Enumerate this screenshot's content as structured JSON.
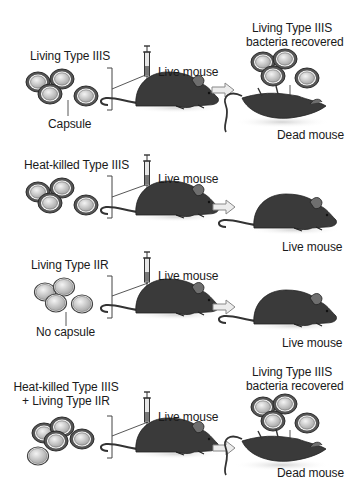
{
  "experiments": [
    {
      "injected_label": "Living Type IIIS",
      "bacteria_annotation": "Capsule",
      "injection_target": "Live mouse",
      "result_bacteria_label_line1": "Living Type IIIS",
      "result_bacteria_label_line2": "bacteria recovered",
      "outcome": "Dead mouse"
    },
    {
      "injected_label": "Heat-killed Type IIIS",
      "injection_target": "Live mouse",
      "outcome": "Live mouse"
    },
    {
      "injected_label": "Living Type IIR",
      "bacteria_annotation": "No capsule",
      "injection_target": "Live mouse",
      "outcome": "Live mouse"
    },
    {
      "injected_label_line1": "Heat-killed Type IIIS",
      "injected_label_line2": "+ Living Type IIR",
      "injection_target": "Live mouse",
      "result_bacteria_label_line1": "Living Type IIIS",
      "result_bacteria_label_line2": "bacteria recovered",
      "outcome": "Dead mouse"
    }
  ],
  "icons": [
    "bacteria-cluster-icon",
    "syringe-icon",
    "mouse-icon",
    "arrow-right-icon",
    "dead-mouse-icon"
  ],
  "colors": {
    "mouse_body": "#3a3a3a",
    "mouse_ear": "#6e6e6e",
    "capsule_ring": "#4a4a4a",
    "cell_fill": "#c8c8c8",
    "arrow_fill": "#e8e8e8",
    "shadow": "#dcdcdc"
  }
}
